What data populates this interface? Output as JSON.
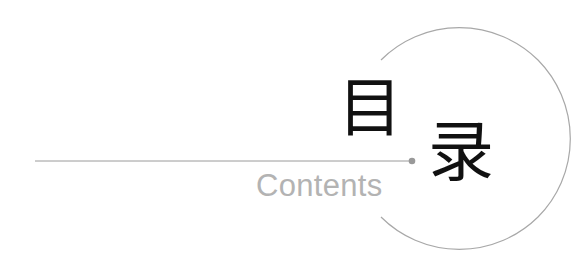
{
  "title": {
    "first_char": "目",
    "second_char": "录"
  },
  "subtitle": "Contents",
  "colors": {
    "title_text": "#111111",
    "subtitle_text": "#b3b3b3",
    "line": "#9a9a9a",
    "circle": "#a8a8a8",
    "dot": "#999999"
  }
}
